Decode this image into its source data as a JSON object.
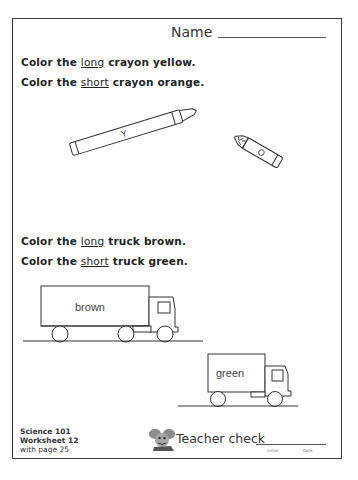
{
  "header": {
    "name_label": "Name"
  },
  "crayon_section": {
    "instruction_1": {
      "prefix": "Color the ",
      "keyword": "long",
      "suffix": " crayon yellow."
    },
    "instruction_2": {
      "prefix": "Color the ",
      "keyword": "short",
      "suffix": " crayon orange."
    },
    "long_crayon_label": "Y",
    "short_crayon_label": "O"
  },
  "truck_section": {
    "instruction_1": {
      "prefix": "Color the ",
      "keyword": "long",
      "suffix": " truck brown."
    },
    "instruction_2": {
      "prefix": "Color the ",
      "keyword": "short",
      "suffix": " truck green."
    },
    "long_truck_label": "brown",
    "short_truck_label": "green"
  },
  "footer": {
    "course": "Science 101",
    "worksheet": "Worksheet 12",
    "page_ref": "with page 25",
    "teacher_check_label": "Teacher check",
    "initial_label": "Initial",
    "date_label": "Date"
  },
  "colors": {
    "border": "#3a3a3a",
    "ink": "#2a2a2a",
    "background": "#ffffff"
  }
}
